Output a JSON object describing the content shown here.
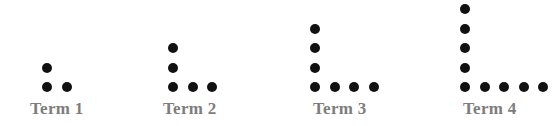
{
  "figure": {
    "title": "",
    "background_color": "#ffffff",
    "dot_color": "#111111",
    "label_color": "#7d7d7d",
    "dot_diameter_px": 10,
    "grid_spacing_px": 19.5,
    "baseline_y_px": 87,
    "label_y_px": 100,
    "pattern_rule": "Term n is an L-shape: a vertical column of n+1 dots and a horizontal row of n+1 dots sharing the corner dot, total 2n+1 dots"
  },
  "terms": [
    {
      "label": "Term 1",
      "index": 1,
      "column_dots": 2,
      "row_dots": 2,
      "total_dots": 3,
      "corner_x_px": 47,
      "label_x_px": 30
    },
    {
      "label": "Term 2",
      "index": 2,
      "column_dots": 3,
      "row_dots": 3,
      "total_dots": 5,
      "corner_x_px": 173,
      "label_x_px": 163
    },
    {
      "label": "Term 3",
      "index": 3,
      "column_dots": 4,
      "row_dots": 4,
      "total_dots": 7,
      "corner_x_px": 315,
      "label_x_px": 313
    },
    {
      "label": "Term 4",
      "index": 4,
      "column_dots": 5,
      "row_dots": 5,
      "total_dots": 9,
      "corner_x_px": 465,
      "label_x_px": 463
    }
  ]
}
